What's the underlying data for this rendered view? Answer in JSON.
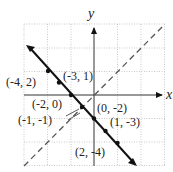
{
  "diagram": {
    "type": "coordinate-plane",
    "axis_labels": {
      "x": "x",
      "y": "y"
    },
    "grid": {
      "x_range": [
        -4,
        2
      ],
      "y_range": [
        -3,
        3
      ],
      "origin_px": [
        94,
        95
      ],
      "unit_px": 23.5
    },
    "lines": [
      {
        "name": "solid-line",
        "equation": "y = -x - 2",
        "style": "solid",
        "arrows": "both"
      },
      {
        "name": "dashed-line",
        "equation": "y = x",
        "style": "dashed"
      }
    ],
    "points": [
      {
        "label": "(-4, 2)",
        "x": -4,
        "y": 2
      },
      {
        "label": "(-3, 1)",
        "x": -3,
        "y": 1
      },
      {
        "label": "(-2, 0)",
        "x": -2,
        "y": 0
      },
      {
        "label": "(-1, -1)",
        "x": -1,
        "y": -1
      },
      {
        "label": "(0, -2)",
        "x": 0,
        "y": -2
      },
      {
        "label": "(1, -3)",
        "x": 1,
        "y": -3
      },
      {
        "label": "(2, -4)",
        "x": 2,
        "y": -4
      }
    ]
  }
}
